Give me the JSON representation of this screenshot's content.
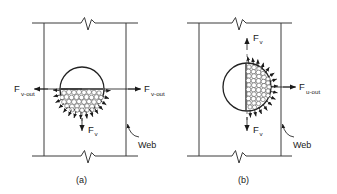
{
  "figure": {
    "background_color": "#ffffff",
    "stroke_color": "#333333",
    "panels": [
      {
        "id": "panel-a",
        "caption": "(a)",
        "bubble_fill_region": "lower-hemisphere",
        "labels": {
          "force_left": {
            "base": "F",
            "sub": "v-out"
          },
          "force_right": {
            "base": "F",
            "sub": "v-out"
          },
          "force_vertical": {
            "base": "F",
            "sub": "v"
          },
          "web": "Web"
        }
      },
      {
        "id": "panel-b",
        "caption": "(b)",
        "bubble_fill_region": "right-hemisphere",
        "labels": {
          "force_right": {
            "base": "F",
            "sub": "u-out"
          },
          "force_vertical_top": {
            "base": "F",
            "sub": "v"
          },
          "force_vertical_bottom": {
            "base": "F",
            "sub": "v"
          },
          "web": "Web"
        }
      }
    ]
  }
}
